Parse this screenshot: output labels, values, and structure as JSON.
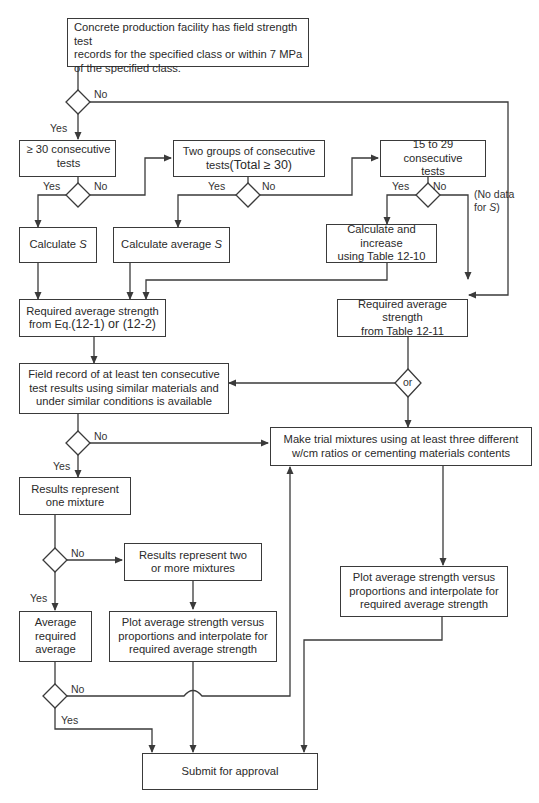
{
  "diagram": {
    "type": "flowchart",
    "nodes": {
      "start": {
        "lines": [
          "Concrete production facility has field strength test",
          "records for the specified class or within 7 MPa",
          "of the specified class."
        ]
      },
      "tests30": {
        "lines": [
          "≥ 30 consecutive",
          "tests"
        ]
      },
      "twogroups": {
        "line1": "Two groups of consecutive",
        "line2_prefix": "tests",
        "line2_big": "(Total ≥ 30)"
      },
      "tests15": {
        "lines": [
          "15 to 29 consecutive",
          "tests"
        ]
      },
      "calcS": {
        "prefix": "Calculate ",
        "var": "S"
      },
      "calcAvgS": {
        "prefix": "Calculate average ",
        "var": "S"
      },
      "calcIncrease": {
        "lines": [
          "Calculate and increase",
          "using Table 12-10"
        ]
      },
      "reqEq": {
        "line1": "Required average strength",
        "line2_prefix": "from Eq.",
        "line2_big": "(12-1) or (12-2)"
      },
      "reqTable": {
        "lines": [
          "Required average strength",
          "from Table 12-11"
        ]
      },
      "fieldRecord": {
        "lines": [
          "Field record of at least ten consecutive",
          "test results using similar materials and",
          "under similar conditions is available"
        ]
      },
      "trialMix": {
        "lines": [
          "Make trial mixtures using at least three different",
          "w/cm ratios or cementing materials contents"
        ]
      },
      "oneMixture": {
        "lines": [
          "Results represent",
          "one mixture"
        ]
      },
      "twoMixtures": {
        "lines": [
          "Results represent two",
          "or more mixtures"
        ]
      },
      "avgRequired": {
        "lines": [
          "Average",
          "required",
          "average"
        ]
      },
      "plotLeft": {
        "lines": [
          "Plot average strength versus",
          "proportions and interpolate for",
          "required average strength"
        ]
      },
      "plotRight": {
        "lines": [
          "Plot average strength versus",
          "proportions and interpolate for",
          "required average strength"
        ]
      },
      "submit": {
        "lines": [
          "Submit for approval"
        ]
      }
    },
    "labels": {
      "yes": "Yes",
      "no": "No",
      "or": "or",
      "nodata_line1": "(No data",
      "nodata_line2_prefix": "for ",
      "nodata_var": "S",
      "nodata_suffix": ")"
    },
    "colors": {
      "line": "#3a3a3a",
      "text": "#2a2a2a",
      "background": "#ffffff"
    }
  }
}
